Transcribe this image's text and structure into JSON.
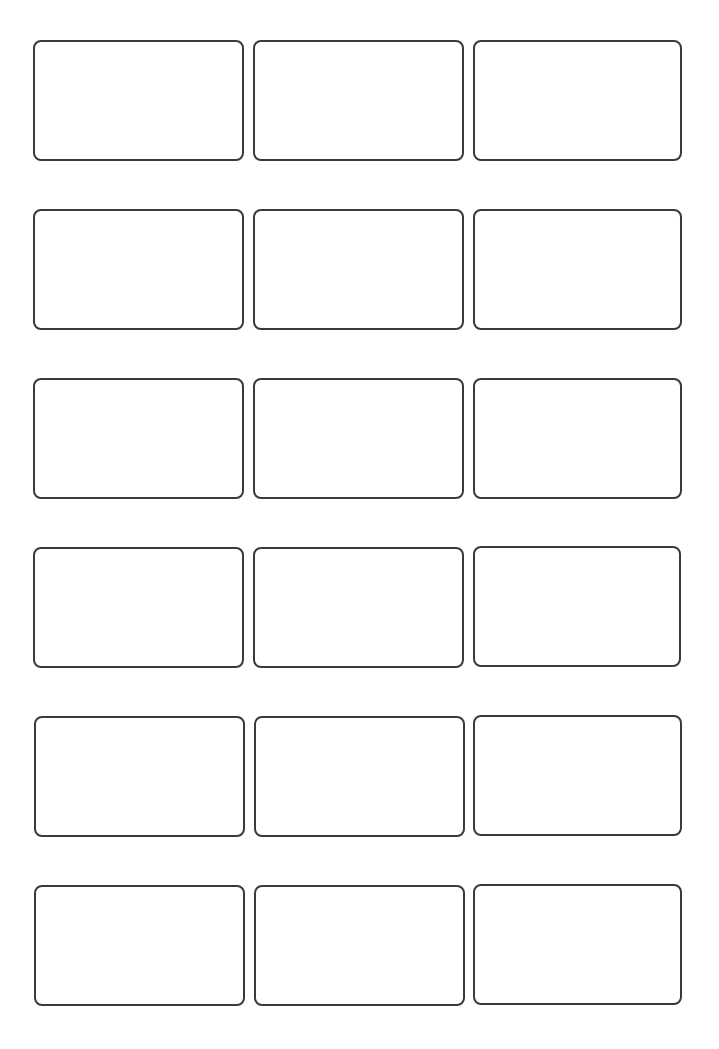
{
  "page": {
    "background": "#ffffff",
    "card_border_color": "#3a3a3a",
    "card_border_width": 2,
    "card_corner_radius": 8
  },
  "grid": {
    "columns": 3,
    "rows": 6,
    "cards": [
      {
        "row": 1,
        "col": 1,
        "x": 33,
        "y": 40,
        "w": 211,
        "h": 121,
        "text": ""
      },
      {
        "row": 1,
        "col": 2,
        "x": 253,
        "y": 40,
        "w": 211,
        "h": 121,
        "text": ""
      },
      {
        "row": 1,
        "col": 3,
        "x": 473,
        "y": 40,
        "w": 209,
        "h": 121,
        "text": ""
      },
      {
        "row": 2,
        "col": 1,
        "x": 33,
        "y": 209,
        "w": 211,
        "h": 121,
        "text": ""
      },
      {
        "row": 2,
        "col": 2,
        "x": 253,
        "y": 209,
        "w": 211,
        "h": 121,
        "text": ""
      },
      {
        "row": 2,
        "col": 3,
        "x": 473,
        "y": 209,
        "w": 209,
        "h": 121,
        "text": ""
      },
      {
        "row": 3,
        "col": 1,
        "x": 33,
        "y": 378,
        "w": 211,
        "h": 121,
        "text": ""
      },
      {
        "row": 3,
        "col": 2,
        "x": 253,
        "y": 378,
        "w": 211,
        "h": 121,
        "text": ""
      },
      {
        "row": 3,
        "col": 3,
        "x": 473,
        "y": 378,
        "w": 209,
        "h": 121,
        "text": ""
      },
      {
        "row": 4,
        "col": 1,
        "x": 33,
        "y": 547,
        "w": 211,
        "h": 121,
        "text": ""
      },
      {
        "row": 4,
        "col": 2,
        "x": 253,
        "y": 547,
        "w": 211,
        "h": 121,
        "text": ""
      },
      {
        "row": 4,
        "col": 3,
        "x": 473,
        "y": 546,
        "w": 208,
        "h": 121,
        "text": ""
      },
      {
        "row": 5,
        "col": 1,
        "x": 34,
        "y": 716,
        "w": 211,
        "h": 121,
        "text": ""
      },
      {
        "row": 5,
        "col": 2,
        "x": 254,
        "y": 716,
        "w": 211,
        "h": 121,
        "text": ""
      },
      {
        "row": 5,
        "col": 3,
        "x": 473,
        "y": 715,
        "w": 209,
        "h": 121,
        "text": ""
      },
      {
        "row": 6,
        "col": 1,
        "x": 34,
        "y": 885,
        "w": 211,
        "h": 121,
        "text": ""
      },
      {
        "row": 6,
        "col": 2,
        "x": 254,
        "y": 885,
        "w": 211,
        "h": 121,
        "text": ""
      },
      {
        "row": 6,
        "col": 3,
        "x": 473,
        "y": 884,
        "w": 209,
        "h": 121,
        "text": ""
      }
    ]
  }
}
